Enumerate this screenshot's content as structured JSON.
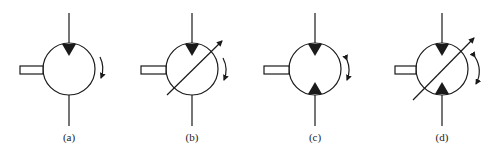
{
  "figure": {
    "stroke_color": "#1a1a1a",
    "symbols": [
      {
        "id": "a",
        "label": "(a)",
        "cx": 69,
        "variable": false,
        "ports": "top-inlet",
        "rotation": "one-direction"
      },
      {
        "id": "b",
        "label": "(b)",
        "cx": 192,
        "variable": true,
        "ports": "top-inlet",
        "rotation": "one-direction"
      },
      {
        "id": "c",
        "label": "(c)",
        "cx": 315,
        "variable": false,
        "ports": "both",
        "rotation": "two-direction"
      },
      {
        "id": "d",
        "label": "(d)",
        "cx": 442,
        "variable": true,
        "ports": "both",
        "rotation": "two-direction"
      }
    ]
  }
}
